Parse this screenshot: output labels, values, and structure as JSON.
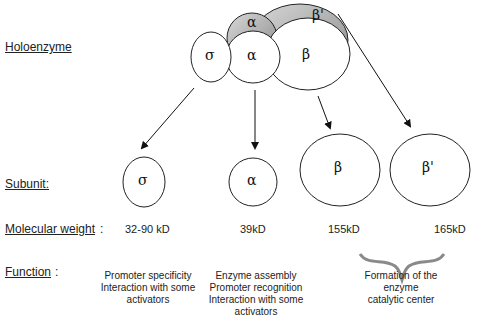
{
  "row_labels": {
    "holoenzyme": "Holoenzyme",
    "subunit": "Subunit:",
    "molecular_weight": "Molecular weight",
    "molecular_weight_colon": ":",
    "function": "Function",
    "function_colon": ":"
  },
  "holoenzyme": {
    "sigma": "σ",
    "alpha_back": "α",
    "alpha_front": "α",
    "beta": "β",
    "beta_prime": "β'"
  },
  "subunits": [
    {
      "symbol": "σ",
      "weight": "32-90 kD",
      "function": [
        "Promoter specificity",
        "Interaction with some",
        "activators"
      ]
    },
    {
      "symbol": "α",
      "weight": "39kD",
      "function": [
        "Enzyme assembly",
        "Promoter recognition",
        "Interaction with some",
        "activators"
      ]
    },
    {
      "symbol": "β",
      "weight": "155kD"
    },
    {
      "symbol": "β'",
      "weight": "165kD"
    }
  ],
  "shared_function": [
    "Formation of the",
    "enzyme",
    "catalytic center"
  ],
  "colors": {
    "shade": "#9a9a9a",
    "stroke": "#222222"
  }
}
